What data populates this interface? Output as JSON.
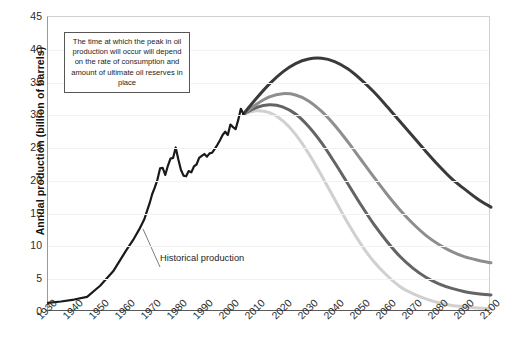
{
  "chart_data": {
    "type": "line",
    "title": "",
    "xlabel": "",
    "ylabel": "Annual production (billion of barrels)",
    "xlim": [
      1930,
      2100
    ],
    "ylim": [
      0,
      45
    ],
    "ytick_step": 5,
    "xtick_step": 10,
    "grid": "horizontal",
    "legend": "none",
    "xticks": [
      "1930",
      "1940",
      "1950",
      "1960",
      "1970",
      "1980",
      "1990",
      "2000",
      "2010",
      "2020",
      "2030",
      "2040",
      "2050",
      "2060",
      "2070",
      "2080",
      "2090",
      "2100"
    ],
    "yticks": [
      "0",
      "5",
      "10",
      "15",
      "20",
      "25",
      "30",
      "35",
      "40",
      "45"
    ],
    "annotations": [
      {
        "name": "peak-oil-note",
        "text": "The time at which the peak in oil production will occur will depend on the rate of consumption and amount of ultimate oil reserves in place"
      },
      {
        "name": "historical-production-label",
        "text": "Historical production"
      }
    ],
    "series": [
      {
        "name": "Historical production",
        "color": "#1a1a1a",
        "width": 2.2,
        "x": [
          1930,
          1935,
          1940,
          1945,
          1950,
          1955,
          1960,
          1963,
          1965,
          1967,
          1969,
          1970,
          1971,
          1972,
          1973,
          1974,
          1975,
          1976,
          1977,
          1978,
          1979,
          1980,
          1981,
          1982,
          1983,
          1984,
          1985,
          1986,
          1987,
          1988,
          1989,
          1990,
          1991,
          1992,
          1993,
          1994,
          1995,
          1996,
          1997,
          1998,
          1999,
          2000,
          2001,
          2002,
          2003,
          2004,
          2005
        ],
        "y": [
          1.4,
          1.5,
          1.8,
          2.1,
          3.4,
          4.9,
          7.3,
          8.6,
          9.6,
          10.7,
          12.3,
          13.3,
          14.0,
          14.9,
          16.1,
          16.2,
          15.5,
          16.5,
          17.3,
          17.4,
          18.5,
          17.3,
          16.2,
          15.6,
          15.5,
          16.0,
          15.9,
          16.5,
          16.7,
          17.4,
          17.6,
          17.8,
          17.6,
          17.9,
          18.0,
          18.4,
          18.8,
          19.3,
          19.9,
          20.2,
          19.9,
          21.0,
          20.8,
          20.6,
          21.6,
          22.8,
          23.0
        ],
        "y_scaled_note": "values rendered on chart reach ~30 at 2005; series uses chart-read values",
        "chart_y": [
          1.4,
          1.6,
          1.9,
          2.3,
          4.0,
          6.2,
          9.4,
          11.2,
          12.6,
          14.2,
          16.6,
          18.0,
          19.0,
          20.2,
          21.9,
          22.0,
          20.9,
          22.3,
          23.4,
          23.5,
          25.1,
          23.3,
          21.7,
          20.8,
          20.7,
          21.5,
          21.3,
          22.2,
          22.5,
          23.5,
          23.8,
          24.1,
          23.7,
          24.2,
          24.3,
          24.9,
          25.5,
          26.2,
          27.0,
          27.5,
          27.0,
          28.6,
          28.2,
          27.9,
          29.3,
          31.0,
          30.2
        ]
      },
      {
        "name": "High ultimate reserves scenario",
        "color": "#3a3a3a",
        "width": 3.0,
        "peak_year": 2035,
        "peak_value": 38.7,
        "end_year": 2100,
        "end_value": 16.0,
        "x": [
          2005,
          2010,
          2015,
          2020,
          2025,
          2030,
          2035,
          2040,
          2045,
          2050,
          2055,
          2060,
          2065,
          2070,
          2075,
          2080,
          2085,
          2090,
          2095,
          2100
        ],
        "chart_y": [
          30.2,
          32.6,
          34.8,
          36.6,
          37.9,
          38.6,
          38.7,
          38.2,
          37.1,
          35.5,
          33.6,
          31.4,
          29.1,
          26.8,
          24.5,
          22.3,
          20.3,
          18.7,
          17.2,
          16.0
        ]
      },
      {
        "name": "Medium-high reserves scenario",
        "color": "#8e8e8e",
        "width": 3.0,
        "peak_year": 2020,
        "peak_value": 33.3,
        "end_year": 2100,
        "end_value": 7.5,
        "x": [
          2005,
          2010,
          2015,
          2020,
          2025,
          2030,
          2035,
          2040,
          2045,
          2050,
          2055,
          2060,
          2065,
          2070,
          2075,
          2080,
          2085,
          2090,
          2095,
          2100
        ],
        "chart_y": [
          30.2,
          31.7,
          32.8,
          33.3,
          33.1,
          32.2,
          30.6,
          28.5,
          26.0,
          23.3,
          20.6,
          18.0,
          15.6,
          13.5,
          11.7,
          10.3,
          9.2,
          8.4,
          7.9,
          7.5
        ]
      },
      {
        "name": "Medium-low reserves scenario",
        "color": "#646464",
        "width": 3.0,
        "peak_year": 2017,
        "peak_value": 31.6,
        "end_year": 2100,
        "end_value": 2.6,
        "x": [
          2005,
          2010,
          2015,
          2020,
          2025,
          2030,
          2035,
          2040,
          2045,
          2050,
          2055,
          2060,
          2065,
          2070,
          2075,
          2080,
          2085,
          2090,
          2095,
          2100
        ],
        "chart_y": [
          30.2,
          31.2,
          31.6,
          31.3,
          30.2,
          28.3,
          25.8,
          22.8,
          19.6,
          16.4,
          13.4,
          10.8,
          8.5,
          6.7,
          5.3,
          4.3,
          3.6,
          3.1,
          2.8,
          2.6
        ]
      },
      {
        "name": "Low ultimate reserves scenario",
        "color": "#d0d0d0",
        "width": 3.0,
        "peak_year": 2012,
        "peak_value": 30.7,
        "end_year": 2100,
        "end_value": 0.5,
        "x": [
          2005,
          2010,
          2015,
          2020,
          2025,
          2030,
          2035,
          2040,
          2045,
          2050,
          2055,
          2060,
          2065,
          2070,
          2075,
          2080,
          2085,
          2090,
          2095,
          2100
        ],
        "chart_y": [
          30.2,
          30.7,
          30.4,
          29.2,
          27.1,
          24.2,
          20.8,
          17.2,
          13.6,
          10.4,
          7.7,
          5.6,
          3.9,
          2.8,
          2.0,
          1.4,
          1.0,
          0.8,
          0.6,
          0.5
        ]
      }
    ]
  }
}
